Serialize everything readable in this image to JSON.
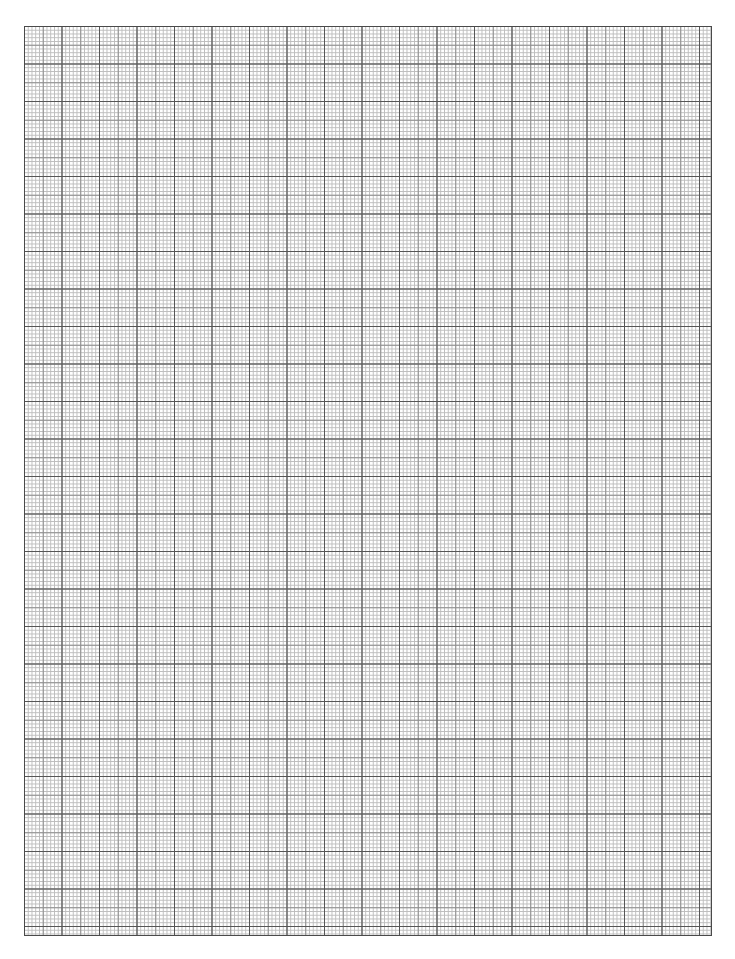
{
  "document": {
    "type": "graph-paper",
    "title": "Graph Paper",
    "page_width_px": 735,
    "page_height_px": 959,
    "page_background_color": "#ffffff",
    "orientation": "portrait"
  },
  "grid": {
    "label": "graph paper grid",
    "left_px": 24,
    "top_px": 26,
    "right_px": 712,
    "bottom_px": 936,
    "width_px": 688,
    "height_px": 910,
    "fine_cell_px": 3.75,
    "medium_cell_px": 18.75,
    "major_cell_px": 37.5,
    "fine_cells_per_medium": 5,
    "fine_cells_per_major": 10,
    "fine_line_color": "#bdbdbd",
    "fine_line_width_px": 1,
    "medium_line_color": "#8f8f8f",
    "medium_line_width_px": 1,
    "major_line_color": "#565656",
    "major_line_width_px": 1,
    "border_color": "#4a4a4a",
    "border_width_px": 1,
    "fine_columns": 183,
    "fine_rows": 242,
    "major_columns": 18,
    "major_rows": 24
  },
  "chart_data": {
    "type": "grid",
    "title": "",
    "xlabel": "",
    "ylabel": "",
    "grid": true,
    "legend": "none",
    "annotations": [],
    "tick_labels_x": [],
    "tick_labels_y": []
  }
}
